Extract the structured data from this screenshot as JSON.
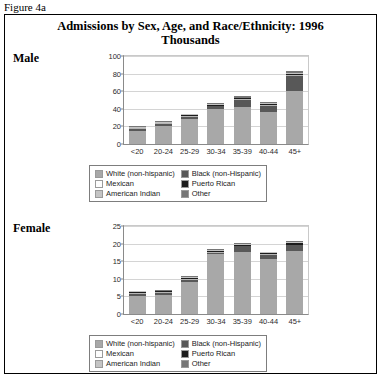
{
  "figure_caption": "Figure 4a",
  "title_line1": "Admissions by Sex, Age, and Race/Ethnicity: 1996",
  "title_line2": "Thousands",
  "panels": [
    {
      "label": "Male"
    },
    {
      "label": "Female"
    }
  ],
  "legend": {
    "items": [
      {
        "label": "White (non-hispanic)",
        "color": "#a8a8a8"
      },
      {
        "label": "Black (non-Hispanic)",
        "color": "#585858"
      },
      {
        "label": "Mexican",
        "color": "#fdfdfd"
      },
      {
        "label": "Puerto Rican",
        "color": "#1c1c1c"
      },
      {
        "label": "American Indian",
        "color": "#c4c4c4"
      },
      {
        "label": "Other",
        "color": "#767676"
      }
    ]
  },
  "chart_data": [
    {
      "type": "bar",
      "stacked": true,
      "title": "Admissions by Sex, Age, and Race/Ethnicity: 1996 - Male",
      "panel": "Male",
      "xlabel": "",
      "ylabel": "Thousands",
      "ylim": [
        0,
        100
      ],
      "yticks": [
        0,
        20,
        40,
        60,
        80,
        100
      ],
      "grid": true,
      "legend_position": "below",
      "categories": [
        "<20",
        "20-24",
        "25-29",
        "30-34",
        "35-39",
        "40-44",
        "45+"
      ],
      "series": [
        {
          "name": "White (non-hispanic)",
          "color": "#a8a8a8",
          "values": [
            15.0,
            21.0,
            28.5,
            40.0,
            42.0,
            36.5,
            60.5
          ]
        },
        {
          "name": "Black (non-Hispanic)",
          "color": "#585858",
          "values": [
            1.8,
            1.6,
            2.5,
            2.8,
            8.0,
            7.2,
            17.0
          ]
        },
        {
          "name": "Mexican",
          "color": "#fdfdfd",
          "values": [
            0.3,
            0.3,
            0.4,
            0.4,
            0.4,
            0.4,
            0.8
          ]
        },
        {
          "name": "Puerto Rican",
          "color": "#1c1c1c",
          "values": [
            0.3,
            0.4,
            0.5,
            0.5,
            0.8,
            0.7,
            1.6
          ]
        },
        {
          "name": "American Indian",
          "color": "#c4c4c4",
          "values": [
            0.2,
            0.3,
            0.4,
            0.5,
            0.5,
            0.4,
            0.9
          ]
        },
        {
          "name": "Other",
          "color": "#767676",
          "values": [
            0.4,
            0.4,
            0.7,
            0.8,
            1.3,
            0.8,
            2.2
          ]
        }
      ],
      "totals": [
        18.0,
        24.0,
        33.0,
        45.0,
        53.0,
        46.0,
        83.0
      ]
    },
    {
      "type": "bar",
      "stacked": true,
      "title": "Admissions by Sex, Age, and Race/Ethnicity: 1996 - Female",
      "panel": "Female",
      "xlabel": "",
      "ylabel": "Thousands",
      "ylim": [
        0,
        25
      ],
      "yticks": [
        0,
        5,
        10,
        15,
        20,
        25
      ],
      "grid": true,
      "legend_position": "below",
      "categories": [
        "<20",
        "20-24",
        "25-29",
        "30-34",
        "35-39",
        "40-44",
        "45+"
      ],
      "series": [
        {
          "name": "White (non-hispanic)",
          "color": "#a8a8a8",
          "values": [
            5.2,
            5.5,
            9.1,
            17.0,
            17.6,
            15.6,
            17.9
          ]
        },
        {
          "name": "Black (non-Hispanic)",
          "color": "#585858",
          "values": [
            0.55,
            0.5,
            0.7,
            0.45,
            1.6,
            1.2,
            1.6
          ]
        },
        {
          "name": "Mexican",
          "color": "#fdfdfd",
          "values": [
            0.06,
            0.06,
            0.08,
            0.08,
            0.2,
            0.08,
            0.25
          ]
        },
        {
          "name": "Puerto Rican",
          "color": "#1c1c1c",
          "values": [
            0.07,
            0.07,
            0.1,
            0.08,
            0.25,
            0.08,
            0.35
          ]
        },
        {
          "name": "American Indian",
          "color": "#c4c4c4",
          "values": [
            0.05,
            0.06,
            0.07,
            0.07,
            0.15,
            0.06,
            0.2
          ]
        },
        {
          "name": "Other",
          "color": "#767676",
          "values": [
            0.07,
            0.11,
            0.15,
            0.12,
            0.3,
            0.08,
            0.3
          ]
        }
      ],
      "totals": [
        6.0,
        6.3,
        10.2,
        17.8,
        20.1,
        17.1,
        20.6
      ]
    }
  ]
}
